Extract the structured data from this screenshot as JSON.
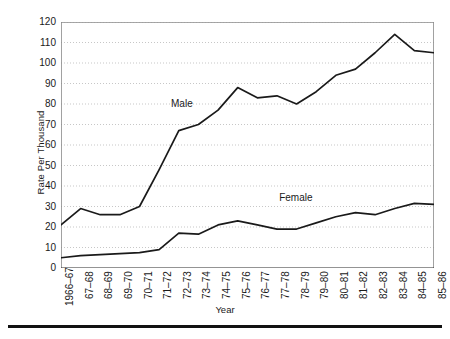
{
  "chart_data": {
    "type": "line",
    "title": "",
    "xlabel": "Year",
    "ylabel": "Rate Per Thousand",
    "categories": [
      "1966–67",
      "67–68",
      "68–69",
      "69–70",
      "70–71",
      "71–72",
      "72–73",
      "73–74",
      "74–75",
      "75–76",
      "76–77",
      "77–78",
      "78–79",
      "79–80",
      "80–81",
      "81–82",
      "82–83",
      "83–84",
      "84–85",
      "85–86"
    ],
    "ylim": [
      0,
      120
    ],
    "yticks": [
      0,
      10,
      20,
      30,
      40,
      50,
      60,
      70,
      80,
      90,
      100,
      110,
      120
    ],
    "ytick_labels": [
      "0",
      "10",
      "20",
      "30",
      "40",
      "50",
      "60",
      "70",
      "80",
      "90",
      "100",
      "110",
      "120"
    ],
    "grid": true,
    "grid_style": "dotted-horizontal",
    "legend_position": "inline-annotation",
    "series": [
      {
        "name": "Male",
        "color": "#1a1a1a",
        "values": [
          21,
          29,
          26,
          26,
          30,
          48,
          67,
          70,
          77,
          88,
          83,
          84,
          80,
          86,
          94,
          97,
          105,
          114,
          106,
          105
        ]
      },
      {
        "name": "Female",
        "color": "#1a1a1a",
        "values": [
          5,
          6,
          6.5,
          7,
          7.5,
          9,
          17,
          16.5,
          21,
          23,
          21,
          19,
          19,
          22,
          25,
          27,
          26,
          29,
          31.5,
          31
        ]
      }
    ],
    "annotations": [
      {
        "text": "Male",
        "x_fraction": 0.295,
        "y_value": 80
      },
      {
        "text": "Female",
        "x_fraction": 0.585,
        "y_value": 34
      }
    ]
  }
}
